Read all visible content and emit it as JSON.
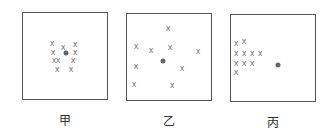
{
  "panels": [
    {
      "label": "甲",
      "box": {
        "x": 22,
        "y": 12,
        "w": 86,
        "h": 88
      },
      "target": {
        "x": 66,
        "y": 53
      },
      "marks": [
        [
          52,
          44
        ],
        [
          63,
          48
        ],
        [
          75,
          45
        ],
        [
          53,
          53
        ],
        [
          75,
          53
        ],
        [
          54,
          61
        ],
        [
          58,
          61
        ],
        [
          73,
          61
        ],
        [
          57,
          70
        ],
        [
          71,
          70
        ]
      ]
    },
    {
      "label": "乙",
      "box": {
        "x": 126,
        "y": 13,
        "w": 86,
        "h": 88
      },
      "target": {
        "x": 163,
        "y": 61
      },
      "marks": [
        [
          168,
          29
        ],
        [
          136,
          47
        ],
        [
          151,
          51
        ],
        [
          170,
          48
        ],
        [
          198,
          52
        ],
        [
          136,
          67
        ],
        [
          182,
          69
        ],
        [
          134,
          85
        ],
        [
          172,
          86
        ]
      ]
    },
    {
      "label": "丙",
      "box": {
        "x": 230,
        "y": 14,
        "w": 86,
        "h": 88
      },
      "target": {
        "x": 278,
        "y": 65
      },
      "marks": [
        [
          236,
          44
        ],
        [
          244,
          42
        ],
        [
          236,
          54
        ],
        [
          244,
          54
        ],
        [
          252,
          54
        ],
        [
          260,
          54
        ],
        [
          236,
          64
        ],
        [
          244,
          64
        ],
        [
          252,
          64
        ],
        [
          236,
          73
        ]
      ]
    }
  ],
  "mark_glyph": "x"
}
